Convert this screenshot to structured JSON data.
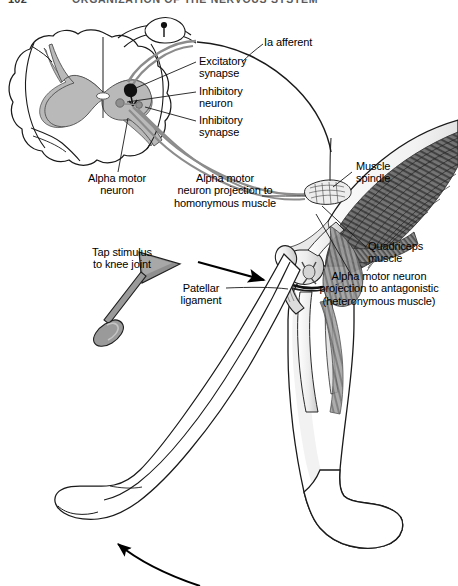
{
  "page": {
    "number": "102",
    "running_head": "ORGANIZATION OF THE NERVOUS SYSTEM"
  },
  "figure": {
    "labels": {
      "ia_afferent": "Ia afferent",
      "excitatory_synapse": "Excitatory\nsynapse",
      "inhibitory_neuron": "Inhibitory\nneuron",
      "inhibitory_synapse": "Inhibitory\nsynapse",
      "alpha_motor_neuron": "Alpha motor\nneuron",
      "homonymous_projection": "Alpha motor\nneuron projection to\nhomonymous muscle",
      "muscle_spindle": "Muscle\nspindle",
      "quadriceps_muscle": "Quadriceps\nmuscle",
      "heteronymous_projection": "Alpha motor neuron\nprojection to antagonistic\n(heteronymous muscle)",
      "tap_stimulus": "Tap stimulus\nto knee joint",
      "patellar_ligament": "Patellar\nligament"
    },
    "colors": {
      "outline": "#1a1a1a",
      "gray_matter": "#b9b9b9",
      "white_matter": "#ffffff",
      "nerve_fiber": "#8c8c8c",
      "neuron_body_dark": "#111111",
      "neuron_body_gray": "#8f8f8f",
      "muscle_dark": "#4a4a4a",
      "muscle_mid": "#7d7d7d",
      "muscle_light": "#d6d6d6",
      "hammer": "#9a9a9a",
      "arrow": "#000000",
      "leader_line": "#1a1a1a"
    }
  }
}
